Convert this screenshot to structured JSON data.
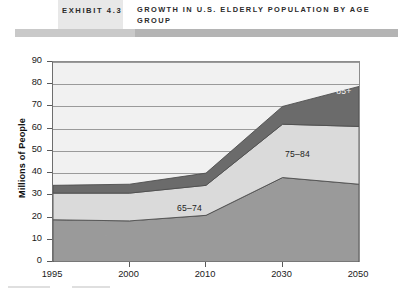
{
  "header": {
    "exhibit_label": "EXHIBIT 4.3",
    "title": "GROWTH IN U.S. ELDERLY POPULATION BY AGE GROUP"
  },
  "chart_data": {
    "type": "area",
    "stacked": true,
    "title": "GROWTH IN U.S. ELDERLY POPULATION BY AGE GROUP",
    "xlabel": "",
    "ylabel": "Millions of People",
    "categories": [
      "1995",
      "2000",
      "2010",
      "2030",
      "2050"
    ],
    "ylim": [
      0,
      90
    ],
    "yticks": [
      0,
      10,
      20,
      30,
      40,
      50,
      60,
      70,
      80,
      90
    ],
    "grid": true,
    "legend_position": "inline-labels",
    "series": [
      {
        "name": "65-74",
        "label": "65–74",
        "color": "#9a9a9a",
        "values": [
          19,
          18.5,
          21,
          38,
          35
        ]
      },
      {
        "name": "75-84",
        "label": "75–84",
        "color": "#dadada",
        "values": [
          12,
          12.5,
          13.5,
          24,
          26
        ]
      },
      {
        "name": "85+",
        "label": "85+",
        "color": "#6b6b6b",
        "values": [
          3.5,
          4,
          5.5,
          8,
          18
        ]
      }
    ],
    "cumulative_tops": {
      "65-74": [
        19,
        18.5,
        21,
        38,
        35
      ],
      "75-84": [
        31,
        31,
        34.5,
        62,
        61
      ],
      "85+": [
        34.5,
        35,
        40,
        70,
        79
      ]
    }
  },
  "labels": {
    "y_axis_title": "Millions of People"
  }
}
